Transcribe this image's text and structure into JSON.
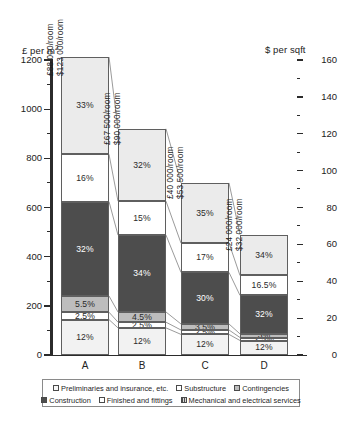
{
  "chart_data": {
    "type": "bar",
    "subtype": "stacked-percentage",
    "title": "",
    "categories": [
      "A",
      "B",
      "C",
      "D"
    ],
    "left_axis": {
      "label": "£ per m",
      "label_sup": "2",
      "ticks": [
        0,
        200,
        400,
        600,
        800,
        1000,
        1200
      ],
      "ylim": [
        0,
        1200
      ],
      "minor_step": 100
    },
    "right_axis": {
      "label": "$ per sqft",
      "ticks": [
        0,
        20,
        40,
        60,
        80,
        100,
        120,
        140,
        160
      ],
      "ylim": [
        0,
        160
      ],
      "minor_step": 10
    },
    "grid": false,
    "legend_position": "bottom",
    "series": [
      {
        "name": "Preliminaries and insurance, etc.",
        "key": "prelim",
        "fill": "#f2f2f2",
        "values": [
          12,
          12,
          12,
          12
        ]
      },
      {
        "name": "Substructure",
        "key": "sub",
        "fill": "#ffffff",
        "values": [
          2.5,
          2.5,
          2.5,
          2.5
        ]
      },
      {
        "name": "Contingencies",
        "key": "cont",
        "fill": "#bdbdbd",
        "values": [
          5.5,
          4.5,
          3.5,
          3
        ]
      },
      {
        "name": "Construction",
        "key": "constr",
        "fill": "#4d4d4d",
        "values": [
          32,
          34,
          30,
          32
        ]
      },
      {
        "name": "Finished and fittings",
        "key": "finish",
        "fill": "#ffffff",
        "values": [
          16,
          15,
          17,
          16.5
        ]
      },
      {
        "name": "Mechanical and electrical services",
        "key": "mech",
        "fill": "#ebebeb",
        "values": [
          33,
          32,
          35,
          34
        ]
      }
    ],
    "bar_totals_left_axis": [
      1200,
      920,
      700,
      490
    ],
    "bars": [
      {
        "category": "A",
        "total_left": 1200,
        "cost_per_room_gbp": "£88 000/room",
        "cost_per_room_usd": "$123 000/room",
        "segments": [
          {
            "key": "prelim",
            "label": "12%",
            "value": 12
          },
          {
            "key": "sub",
            "label": "2.5%",
            "value": 2.5
          },
          {
            "key": "cont",
            "label": "5.5%",
            "value": 5.5
          },
          {
            "key": "constr",
            "label": "32%",
            "value": 32
          },
          {
            "key": "finish",
            "label": "16%",
            "value": 16
          },
          {
            "key": "mech",
            "label": "33%",
            "value": 33
          }
        ]
      },
      {
        "category": "B",
        "total_left": 920,
        "cost_per_room_gbp": "£67 500/room",
        "cost_per_room_usd": "$90 000/room",
        "segments": [
          {
            "key": "prelim",
            "label": "12%",
            "value": 12
          },
          {
            "key": "sub",
            "label": "2.5%",
            "value": 2.5
          },
          {
            "key": "cont",
            "label": "4.5%",
            "value": 4.5
          },
          {
            "key": "constr",
            "label": "34%",
            "value": 34
          },
          {
            "key": "finish",
            "label": "15%",
            "value": 15
          },
          {
            "key": "mech",
            "label": "32%",
            "value": 32
          }
        ]
      },
      {
        "category": "C",
        "total_left": 700,
        "cost_per_room_gbp": "£40 000/room",
        "cost_per_room_usd": "$53 500/room",
        "segments": [
          {
            "key": "prelim",
            "label": "12%",
            "value": 12
          },
          {
            "key": "sub",
            "label": "2.5%",
            "value": 2.5
          },
          {
            "key": "cont",
            "label": "3.5%",
            "value": 3.5
          },
          {
            "key": "constr",
            "label": "30%",
            "value": 30
          },
          {
            "key": "finish",
            "label": "17%",
            "value": 17
          },
          {
            "key": "mech",
            "label": "35%",
            "value": 35
          }
        ]
      },
      {
        "category": "D",
        "total_left": 490,
        "cost_per_room_gbp": "£24 000/room",
        "cost_per_room_usd": "$32 000/room",
        "segments": [
          {
            "key": "prelim",
            "label": "12%",
            "value": 12
          },
          {
            "key": "sub",
            "label": "2.5%",
            "value": 2.5
          },
          {
            "key": "cont",
            "label": "3%",
            "value": 3
          },
          {
            "key": "constr",
            "label": "32%",
            "value": 32
          },
          {
            "key": "finish",
            "label": "16.5%",
            "value": 16.5
          },
          {
            "key": "mech",
            "label": "34%",
            "value": 34
          }
        ]
      }
    ]
  },
  "legend": {
    "row1": [
      {
        "key": "prelim",
        "label": "Preliminaries and insurance, etc."
      },
      {
        "key": "sub",
        "label": "Substructure"
      },
      {
        "key": "cont",
        "label": "Contingencies"
      }
    ],
    "row2": [
      {
        "key": "constr",
        "label": "Construction"
      },
      {
        "key": "finish",
        "label": "Finished and fittings"
      },
      {
        "key": "mech",
        "label": "Mechanical and electrical services"
      }
    ]
  }
}
